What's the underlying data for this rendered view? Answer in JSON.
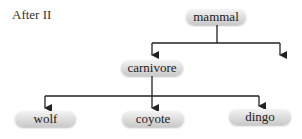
{
  "title": "After II",
  "nodes": {
    "mammal": "mammal",
    "carnivore": "carnivore",
    "wolf": "wolf",
    "coyote": "coyote",
    "dingo": "dingo"
  },
  "edges": [
    {
      "from": "mammal",
      "to": "carnivore"
    },
    {
      "from": "mammal",
      "to": "(unlabeled)"
    },
    {
      "from": "carnivore",
      "to": "wolf"
    },
    {
      "from": "carnivore",
      "to": "coyote"
    },
    {
      "from": "carnivore",
      "to": "dingo"
    }
  ],
  "colors": {
    "line": "#222222",
    "node_fill": "#dcdcdc",
    "text": "#222222"
  }
}
